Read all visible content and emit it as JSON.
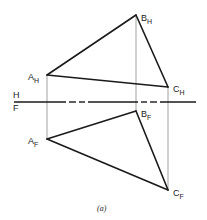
{
  "figure": {
    "caption": "(a)",
    "folding_line": {
      "upper_label": "H",
      "lower_label": "F"
    },
    "horizontal_view": {
      "name": "H",
      "points": [
        {
          "label": "A",
          "sub": "H",
          "x": 47,
          "y": 75
        },
        {
          "label": "B",
          "sub": "H",
          "x": 136,
          "y": 15
        },
        {
          "label": "C",
          "sub": "H",
          "x": 168,
          "y": 87
        }
      ]
    },
    "frontal_view": {
      "name": "F",
      "points": [
        {
          "label": "A",
          "sub": "F",
          "x": 47,
          "y": 139
        },
        {
          "label": "B",
          "sub": "F",
          "x": 136,
          "y": 111
        },
        {
          "label": "C",
          "sub": "F",
          "x": 168,
          "y": 190
        }
      ]
    }
  }
}
